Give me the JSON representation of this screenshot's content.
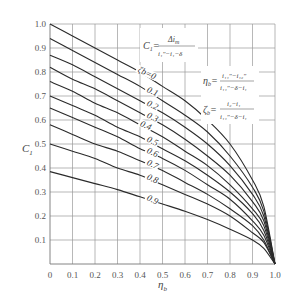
{
  "chart_data": {
    "type": "line",
    "title": "",
    "xlabel": "η_b",
    "ylabel": "C_1",
    "xlim": [
      0,
      1.0
    ],
    "ylim": [
      0,
      1.0
    ],
    "grid": true,
    "x_ticks": [
      "0",
      "0.1",
      "0.2",
      "0.3",
      "0.4",
      "0.5",
      "0.6",
      "0.7",
      "0.8",
      "0.9",
      "1.0"
    ],
    "y_ticks": [
      "0.1",
      "0.2",
      "0.3",
      "0.4",
      "0.5",
      "0.6",
      "0.7",
      "0.8",
      "0.9",
      "1.0"
    ],
    "x": [
      0,
      0.1,
      0.2,
      0.3,
      0.4,
      0.5,
      0.6,
      0.7,
      0.8,
      0.9,
      0.95,
      1.0
    ],
    "series": [
      {
        "name": "ζb=0",
        "label": "ζb=0",
        "values": [
          1.0,
          0.95,
          0.9,
          0.85,
          0.8,
          0.74,
          0.68,
          0.6,
          0.5,
          0.35,
          0.24,
          0
        ]
      },
      {
        "name": "0.1",
        "label": "0.1",
        "values": [
          0.94,
          0.89,
          0.84,
          0.79,
          0.74,
          0.68,
          0.62,
          0.55,
          0.45,
          0.32,
          0.22,
          0
        ]
      },
      {
        "name": "0.2",
        "label": "0.2",
        "values": [
          0.87,
          0.83,
          0.78,
          0.73,
          0.68,
          0.63,
          0.57,
          0.5,
          0.41,
          0.29,
          0.2,
          0
        ]
      },
      {
        "name": "0.3",
        "label": "0.3",
        "values": [
          0.82,
          0.77,
          0.73,
          0.68,
          0.63,
          0.58,
          0.52,
          0.45,
          0.37,
          0.26,
          0.18,
          0
        ]
      },
      {
        "name": "0.4",
        "label": "0.4",
        "values": [
          0.76,
          0.72,
          0.67,
          0.63,
          0.58,
          0.53,
          0.47,
          0.41,
          0.33,
          0.23,
          0.16,
          0
        ]
      },
      {
        "name": "0.5",
        "label": "0.5",
        "values": [
          0.7,
          0.66,
          0.62,
          0.57,
          0.53,
          0.48,
          0.43,
          0.37,
          0.3,
          0.21,
          0.14,
          0
        ]
      },
      {
        "name": "0.6",
        "label": "0.6",
        "values": [
          0.65,
          0.61,
          0.57,
          0.53,
          0.48,
          0.44,
          0.39,
          0.33,
          0.27,
          0.18,
          0.12,
          0
        ]
      },
      {
        "name": "0.7",
        "label": "0.7",
        "values": [
          0.58,
          0.54,
          0.5,
          0.47,
          0.43,
          0.39,
          0.34,
          0.29,
          0.23,
          0.16,
          0.1,
          0
        ]
      },
      {
        "name": "0.8",
        "label": "0.8",
        "values": [
          0.5,
          0.47,
          0.44,
          0.4,
          0.37,
          0.33,
          0.29,
          0.25,
          0.2,
          0.13,
          0.09,
          0
        ]
      },
      {
        "name": "0.9",
        "label": "0.9",
        "values": [
          0.385,
          0.36,
          0.335,
          0.31,
          0.28,
          0.25,
          0.22,
          0.185,
          0.145,
          0.1,
          0.065,
          0
        ]
      }
    ],
    "annotations": [
      {
        "text": "C1 = Δi_m / (i1'' − i1 − δ)"
      },
      {
        "text": "η_b = (i11'' − i12'') / (i11'' − δ − i1)"
      },
      {
        "text": "ζ_b = (i2 − i1) / (i11'' − δ − i1)"
      }
    ]
  },
  "labels": {
    "xlabel_main": "η",
    "xlabel_sub": "b",
    "ylabel_main": "C",
    "ylabel_sub": "1",
    "f1_lhs": "C",
    "f1_lhs_sub": "1",
    "f1_eq": "=",
    "f1_num": "Δi",
    "f1_num_sub": "m",
    "f1_den": "i₁″−i₁−δ",
    "f2_lhs": "η",
    "f2_lhs_sub": "b",
    "f2_eq": "=",
    "f2_num": "i₁₁″−i₁₂″",
    "f2_den": "i₁₁″−δ−i₁",
    "f3_lhs": "ζ",
    "f3_lhs_sub": "b",
    "f3_eq": "=",
    "f3_num": "i₂−i₁",
    "f3_den": "i₁₁″−δ−i₁"
  },
  "colors": {
    "curve": "#2a2a2a",
    "grid": "#9a9a9a",
    "text": "#555555"
  }
}
